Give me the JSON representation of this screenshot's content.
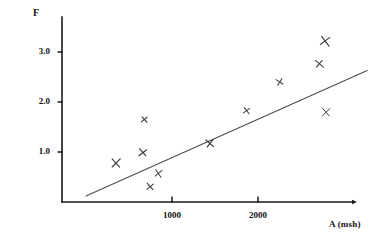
{
  "chart_data": {
    "type": "scatter",
    "title": "",
    "subtitle": "",
    "xlabel": "A (msh)",
    "ylabel": "F",
    "xlim": [
      0,
      3250
    ],
    "ylim": [
      0,
      3.6
    ],
    "grid": false,
    "legend": null,
    "x_ticks": [
      {
        "value": 1000,
        "label": "1000"
      },
      {
        "value": 2000,
        "label": "2000"
      }
    ],
    "y_ticks": [
      {
        "value": 1.0,
        "label": "1.0"
      },
      {
        "value": 2.0,
        "label": "2.0"
      },
      {
        "value": 3.0,
        "label": "3.0"
      }
    ],
    "marker": "x-cross",
    "marker_color": "#3a3a3a",
    "line_color": "#4a4a4a",
    "axis_color": "#1a1a1a",
    "series": [
      {
        "name": "observations",
        "type": "scatter",
        "points": [
          {
            "x": 350,
            "y": 0.78
          },
          {
            "x": 680,
            "y": 1.65
          },
          {
            "x": 660,
            "y": 0.99
          },
          {
            "x": 745,
            "y": 0.31
          },
          {
            "x": 840,
            "y": 0.57
          },
          {
            "x": 1440,
            "y": 1.18
          },
          {
            "x": 1870,
            "y": 1.83
          },
          {
            "x": 2250,
            "y": 2.4
          },
          {
            "x": 2710,
            "y": 2.77
          },
          {
            "x": 2780,
            "y": 3.22
          },
          {
            "x": 2790,
            "y": 1.8
          }
        ]
      },
      {
        "name": "fit-line",
        "type": "line",
        "endpoints": [
          {
            "x": 0,
            "y": 0.12
          },
          {
            "x": 3270,
            "y": 2.63
          }
        ]
      }
    ]
  },
  "axes": {
    "y_title": "F",
    "x_title": "A (msh)"
  }
}
